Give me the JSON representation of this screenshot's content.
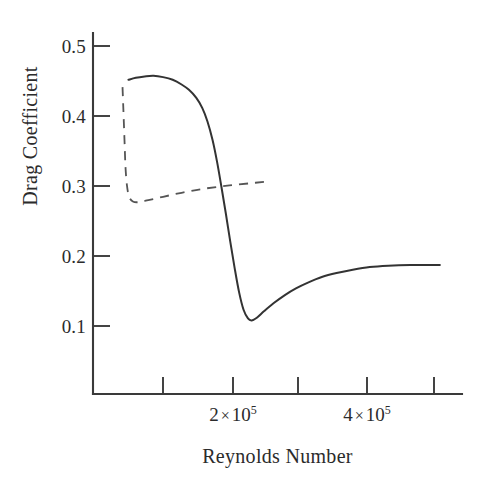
{
  "chart_data": {
    "type": "line",
    "title": "",
    "xlabel": "Reynolds Number",
    "ylabel": "Drag Coefficient",
    "xlim": [
      30000,
      530000
    ],
    "ylim": [
      0.0,
      0.54
    ],
    "grid": false,
    "legend_position": "none",
    "x_tick_values": [
      100000,
      200000,
      300000,
      400000,
      500000
    ],
    "x_tick_labels": [
      "",
      "2 × 10⁵",
      "",
      "4 × 10⁵",
      ""
    ],
    "y_tick_values": [
      0.1,
      0.2,
      0.3,
      0.4,
      0.5
    ],
    "y_tick_labels": [
      "0.1",
      "0.2",
      "0.3",
      "0.4",
      "0.5"
    ],
    "series": [
      {
        "name": "smooth-sphere-drag",
        "style": "solid",
        "color": "#333333",
        "points": [
          [
            78000,
            0.47
          ],
          [
            88000,
            0.473
          ],
          [
            100000,
            0.475
          ],
          [
            112000,
            0.476
          ],
          [
            125000,
            0.474
          ],
          [
            138000,
            0.47
          ],
          [
            150000,
            0.463
          ],
          [
            160000,
            0.455
          ],
          [
            170000,
            0.443
          ],
          [
            178000,
            0.428
          ],
          [
            185000,
            0.408
          ],
          [
            192000,
            0.38
          ],
          [
            198000,
            0.348
          ],
          [
            204000,
            0.31
          ],
          [
            210000,
            0.27
          ],
          [
            216000,
            0.228
          ],
          [
            222000,
            0.188
          ],
          [
            228000,
            0.152
          ],
          [
            234000,
            0.126
          ],
          [
            240000,
            0.113
          ],
          [
            245000,
            0.11
          ],
          [
            252000,
            0.114
          ],
          [
            262000,
            0.124
          ],
          [
            275000,
            0.136
          ],
          [
            290000,
            0.148
          ],
          [
            305000,
            0.158
          ],
          [
            322000,
            0.167
          ],
          [
            340000,
            0.175
          ],
          [
            360000,
            0.181
          ],
          [
            382000,
            0.186
          ],
          [
            405000,
            0.19
          ],
          [
            430000,
            0.192
          ],
          [
            460000,
            0.193
          ],
          [
            500000,
            0.193
          ]
        ]
      },
      {
        "name": "rough-sphere-drag",
        "style": "dashed",
        "color": "#555555",
        "points": [
          [
            70000,
            0.459
          ],
          [
            71000,
            0.43
          ],
          [
            72000,
            0.4
          ],
          [
            73000,
            0.37
          ],
          [
            74000,
            0.34
          ],
          [
            76000,
            0.312
          ],
          [
            79000,
            0.295
          ],
          [
            84000,
            0.288
          ],
          [
            92000,
            0.287
          ],
          [
            105000,
            0.29
          ],
          [
            125000,
            0.295
          ],
          [
            150000,
            0.301
          ],
          [
            180000,
            0.307
          ],
          [
            215000,
            0.312
          ],
          [
            250000,
            0.316
          ],
          [
            268000,
            0.318
          ]
        ]
      }
    ]
  },
  "axes": {
    "x_title": "Reynolds Number",
    "y_title": "Drag Coefficient",
    "y_ticks": [
      {
        "label": "0.5",
        "y": 46
      },
      {
        "label": "0.4",
        "y": 116
      },
      {
        "label": "0.3",
        "y": 186
      },
      {
        "label": "0.2",
        "y": 256
      },
      {
        "label": "0.1",
        "y": 326
      }
    ],
    "x_ticks": [
      {
        "label_mantissa": "",
        "label_exponent": "",
        "x": 163
      },
      {
        "label_mantissa": "2",
        "label_exponent": "5",
        "x": 233
      },
      {
        "label_mantissa": "",
        "label_exponent": "",
        "x": 298
      },
      {
        "label_mantissa": "4",
        "label_exponent": "5",
        "x": 367
      },
      {
        "label_mantissa": "",
        "label_exponent": "",
        "x": 434
      }
    ],
    "times_symbol": "×",
    "base": "10"
  },
  "colors": {
    "axis": "#3a3a3a",
    "solid_series": "#333333",
    "dashed_series": "#555555",
    "background": "#ffffff",
    "text": "#2b2b2b"
  }
}
